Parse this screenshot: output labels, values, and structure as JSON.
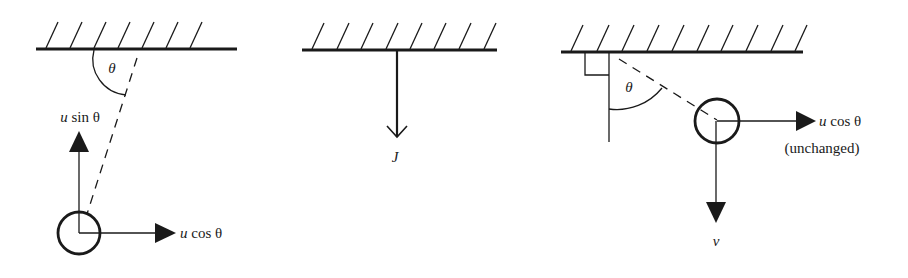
{
  "diagram": {
    "panels": [
      {
        "id": "before-impact",
        "labels": {
          "angle": "θ",
          "vertical_component_var": "u",
          "vertical_component_fn": "sin θ",
          "horizontal_component_var": "u",
          "horizontal_component_fn": "cos θ"
        }
      },
      {
        "id": "impulse",
        "labels": {
          "impulse": "J"
        }
      },
      {
        "id": "after-impact",
        "labels": {
          "angle": "θ",
          "horizontal_component_var": "u",
          "horizontal_component_fn": "cos θ",
          "horizontal_note": "(unchanged)",
          "vertical_component": "v"
        }
      }
    ],
    "colors": {
      "ink": "#1a1a1a",
      "background": "#ffffff"
    }
  }
}
